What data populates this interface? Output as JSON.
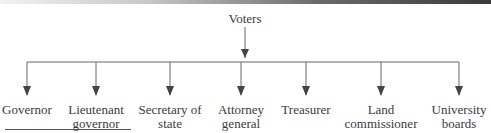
{
  "diagram": {
    "root": {
      "label": "Voters",
      "x": 245
    },
    "children": [
      {
        "label_lines": [
          "Governor"
        ],
        "x": 27
      },
      {
        "label_lines": [
          "Lieutenant",
          "governor"
        ],
        "x": 96
      },
      {
        "label_lines": [
          "Secretary of",
          "state"
        ],
        "x": 170
      },
      {
        "label_lines": [
          "Attorney",
          "general"
        ],
        "x": 241
      },
      {
        "label_lines": [
          "Treasurer"
        ],
        "x": 306
      },
      {
        "label_lines": [
          "Land",
          "commissioner"
        ],
        "x": 381
      },
      {
        "label_lines": [
          "University",
          "boards"
        ],
        "x": 459
      }
    ],
    "colors": {
      "line": "#555555",
      "text": "#3b3b3b"
    }
  }
}
